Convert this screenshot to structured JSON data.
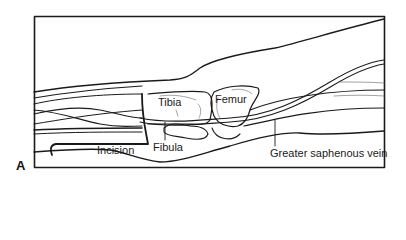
{
  "figure": {
    "panel_letter": "A",
    "labels": {
      "tibia": "Tibia",
      "femur": "Femur",
      "fibula": "Fibula",
      "incision": "Incision",
      "greater_saphenous_vein": "Greater saphenous vein"
    },
    "colors": {
      "line": "#1a1a1a",
      "background": "#ffffff"
    }
  }
}
